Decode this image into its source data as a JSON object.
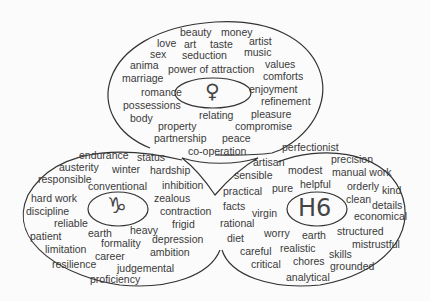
{
  "diagram": {
    "type": "three-lobe word cloud",
    "colors": {
      "outline": "#333333",
      "text": "#3a3a3a",
      "background": "#fbfbfb"
    },
    "lobes": [
      {
        "id": "top",
        "symbol": "♀",
        "symbol_name": "venus-symbol",
        "words": [
          "beauty",
          "money",
          "love",
          "art",
          "taste",
          "artist",
          "sex",
          "seduction",
          "music",
          "anima",
          "power of attraction",
          "values",
          "marriage",
          "comforts",
          "romance",
          "enjoyment",
          "possessions",
          "refinement",
          "body",
          "relating",
          "pleasure",
          "property",
          "compromise",
          "partnership",
          "peace",
          "co-operation"
        ]
      },
      {
        "id": "left",
        "symbol": "♑",
        "symbol_name": "capricorn-symbol",
        "words": [
          "endurance",
          "status",
          "austerity",
          "winter",
          "hardship",
          "responsible",
          "conventional",
          "inhibition",
          "hard work",
          "zealous",
          "discipline",
          "contraction",
          "reliable",
          "frigid",
          "earth",
          "heavy",
          "patient",
          "formality",
          "depression",
          "limitation",
          "career",
          "ambition",
          "resilience",
          "judgemental",
          "proficiency"
        ]
      },
      {
        "id": "right",
        "symbol": "H6",
        "symbol_name": "sixth-house-label",
        "words": [
          "perfectionist",
          "artisan",
          "precision",
          "modest",
          "manual work",
          "sensible",
          "helpful",
          "orderly",
          "kind",
          "practical",
          "pure",
          "clean",
          "details",
          "facts",
          "virgin",
          "economical",
          "rational",
          "worry",
          "earth",
          "structured",
          "diet",
          "mistrustful",
          "careful",
          "realistic",
          "skills",
          "critical",
          "chores",
          "grounded",
          "analytical"
        ]
      }
    ]
  }
}
